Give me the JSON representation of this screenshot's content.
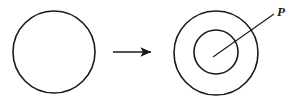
{
  "figure": {
    "background_color": "#ffffff",
    "stroke_color": "#1a1a1a",
    "width": 301,
    "height": 107,
    "labels": {
      "point_p": "P"
    },
    "shapes": {
      "source_circle": {
        "name": "plain-circle",
        "center_x": 54,
        "center_y": 52,
        "radius": 41,
        "stroke_width": 1.6
      },
      "target_outer_circle": {
        "name": "outer-circle",
        "center_x": 216,
        "center_y": 53,
        "radius": 42,
        "stroke_width": 1.6
      },
      "target_inner_circle": {
        "name": "inner-circle",
        "center_x": 216,
        "center_y": 52,
        "radius": 22,
        "stroke_width": 1.6
      },
      "arrow": {
        "name": "transformation-arrow",
        "x1": 113,
        "y1": 52,
        "x2": 155,
        "y2": 52,
        "stroke_width": 1.6
      },
      "leader_line": {
        "name": "p-leader-line",
        "x1": 214,
        "y1": 56,
        "x2": 274,
        "y2": 14,
        "stroke_width": 1.1
      }
    },
    "label_positions": {
      "point_p": {
        "x": 277,
        "y": 15
      }
    }
  }
}
